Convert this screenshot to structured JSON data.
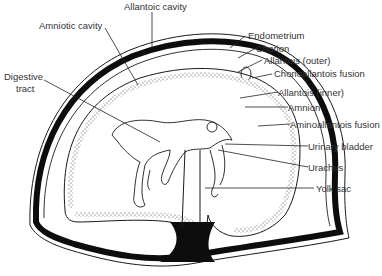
{
  "diagram": {
    "colors": {
      "stroke": "#1a1a1a",
      "fill_dark": "#0d0d0d",
      "label": "#333333",
      "background": "#ffffff"
    },
    "labels": {
      "allantoic_cavity": "Allantoic cavity",
      "amniotic_cavity": "Amniotic cavity",
      "digestive_tract_1": "Digestive",
      "digestive_tract_2": "tract",
      "endometrium": "Endometrium",
      "chorion": "Chorion",
      "allantois_outer": "Allantois (outer)",
      "chorioallantois_fusion": "Chorioallantois fusion",
      "allantois_inner": "Allantois (inner)",
      "amnion": "Amnion",
      "aminoallantois_fusion": "Aminoallantois fusion",
      "urinary_bladder": "Urinary bladder",
      "urachus": "Urachus",
      "yolk_sac": "Yolk sac"
    }
  }
}
